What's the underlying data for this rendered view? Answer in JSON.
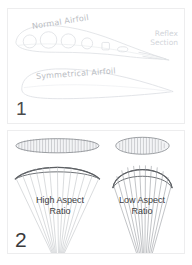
{
  "figure": {
    "background_color": "#ffffff",
    "line_color_faint": "#d9dcdf",
    "line_color_dark": "#6e7073",
    "text_color": "#3c3c3e"
  },
  "panel_1": {
    "number": "1",
    "labels": {
      "normal_airfoil": "Normal Airfoil",
      "reflex_section": "Reflex Section",
      "symmetrical_airfoil": "Symmetrical Airfoil"
    },
    "diagram": {
      "type": "airfoil-cross-sections",
      "shapes": [
        {
          "name": "normal-airfoil-section",
          "description": "cambered airfoil profile with internal cell circles of decreasing size toward trailing edge",
          "cell_count": 6
        },
        {
          "name": "reflex-section",
          "description": "upturned trailing edge region of the normal airfoil"
        },
        {
          "name": "symmetrical-airfoil-section",
          "description": "symmetrical airfoil profile, thick rounded leading edge tapering to sharp trailing edge"
        }
      ]
    }
  },
  "panel_2": {
    "number": "2",
    "labels": {
      "high_aspect_line_1": "High Aspect",
      "high_aspect_line_2": "Ratio",
      "low_aspect_line_1": "Low Aspect",
      "low_aspect_line_2": "Ratio"
    },
    "diagram": {
      "type": "wing-planform-comparison",
      "items": [
        {
          "name": "high-aspect-ratio-wing",
          "planform": "long slender ellipse with spanwise cell ribs",
          "front_view": "wide shallow arc canopy with converging suspension lines",
          "cell_count": 31
        },
        {
          "name": "low-aspect-ratio-wing",
          "planform": "short wide ellipse with spanwise cell ribs",
          "front_view": "narrow deeply arched canopy with converging suspension lines",
          "cell_count": 17
        }
      ]
    }
  },
  "footer": {
    "caption": ""
  }
}
